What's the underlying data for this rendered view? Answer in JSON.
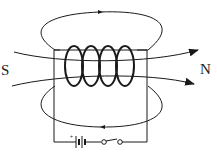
{
  "diagram": {
    "labels": {
      "south": "S",
      "north": "N"
    },
    "components": {
      "coil_turns": 4,
      "battery": "battery-icon",
      "switch": "switch-icon"
    },
    "colors": {
      "line": "#1a1a1a",
      "background": "#ffffff"
    }
  }
}
